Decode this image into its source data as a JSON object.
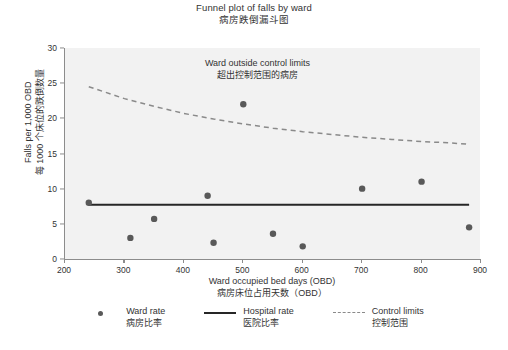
{
  "title": {
    "en": "Funnel plot of falls by ward",
    "zh": "病房跌倒漏斗图"
  },
  "annotation": {
    "en": "Ward outside control limits",
    "zh": "超出控制范围的病房"
  },
  "axes": {
    "x": {
      "en": "Ward occupied bed days (OBD)",
      "zh": "病房床位占用天数（OBD）",
      "ticks": [
        "200",
        "300",
        "400",
        "500",
        "600",
        "700",
        "800",
        "900"
      ]
    },
    "y": {
      "en": "Falls per 1,000 OBD",
      "zh": "每 1000 个床位的跌倒数量",
      "ticks": [
        "0",
        "5",
        "10",
        "15",
        "20",
        "25",
        "30"
      ]
    }
  },
  "legend": [
    {
      "marker": "dot",
      "en": "Ward rate",
      "zh": "病房比率"
    },
    {
      "marker": "solid",
      "en": "Hospital rate",
      "zh": "医院比率"
    },
    {
      "marker": "dash",
      "en": "Control limits",
      "zh": "控制范围"
    }
  ],
  "colors": {
    "point": "#595959",
    "hospital_line": "#262626",
    "control_limit": "#8a8a8a",
    "plot_background": "#f2f2f2",
    "axis": "#8c8c8c"
  },
  "chart_data": {
    "type": "scatter",
    "title": "Funnel plot of falls by ward",
    "subtitle": "病房跌倒漏斗图",
    "xlabel": "Ward occupied bed days (OBD)",
    "ylabel": "Falls per 1,000 OBD",
    "xlim": [
      200,
      900
    ],
    "ylim": [
      0,
      30
    ],
    "xticks": [
      200,
      300,
      400,
      500,
      600,
      700,
      800,
      900
    ],
    "yticks": [
      0,
      5,
      10,
      15,
      20,
      25,
      30
    ],
    "grid": false,
    "legend_position": "below",
    "series": [
      {
        "name": "Ward rate",
        "type": "scatter",
        "points": [
          {
            "x": 240,
            "y": 8.0
          },
          {
            "x": 310,
            "y": 3.0
          },
          {
            "x": 350,
            "y": 5.7
          },
          {
            "x": 440,
            "y": 9.0
          },
          {
            "x": 450,
            "y": 2.3
          },
          {
            "x": 500,
            "y": 22.0
          },
          {
            "x": 550,
            "y": 3.6
          },
          {
            "x": 600,
            "y": 1.8
          },
          {
            "x": 700,
            "y": 10.0
          },
          {
            "x": 800,
            "y": 11.0
          },
          {
            "x": 880,
            "y": 4.5
          }
        ]
      },
      {
        "name": "Hospital rate",
        "type": "line",
        "style": "solid",
        "points": [
          {
            "x": 240,
            "y": 7.7
          },
          {
            "x": 880,
            "y": 7.7
          }
        ]
      },
      {
        "name": "Control limits",
        "type": "line",
        "style": "dashed",
        "points": [
          {
            "x": 240,
            "y": 24.5
          },
          {
            "x": 300,
            "y": 22.8
          },
          {
            "x": 350,
            "y": 21.7
          },
          {
            "x": 400,
            "y": 20.7
          },
          {
            "x": 450,
            "y": 19.9
          },
          {
            "x": 500,
            "y": 19.2
          },
          {
            "x": 550,
            "y": 18.6
          },
          {
            "x": 600,
            "y": 18.1
          },
          {
            "x": 650,
            "y": 17.7
          },
          {
            "x": 700,
            "y": 17.3
          },
          {
            "x": 750,
            "y": 17.0
          },
          {
            "x": 800,
            "y": 16.7
          },
          {
            "x": 850,
            "y": 16.5
          },
          {
            "x": 880,
            "y": 16.3
          }
        ]
      }
    ],
    "annotations": [
      {
        "text": "Ward outside control limits",
        "target_x": 500,
        "target_y": 22.0
      }
    ]
  }
}
